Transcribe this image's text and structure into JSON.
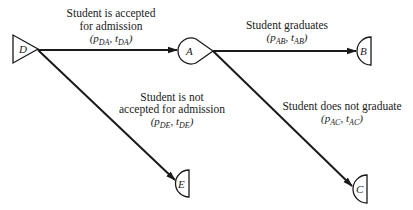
{
  "diagram": {
    "type": "decision-tree",
    "nodes": [
      {
        "id": "D",
        "label": "D",
        "shape": "triangle"
      },
      {
        "id": "A",
        "label": "A",
        "shape": "teardrop"
      },
      {
        "id": "B",
        "label": "B",
        "shape": "half-circle"
      },
      {
        "id": "E",
        "label": "E",
        "shape": "half-circle"
      },
      {
        "id": "C",
        "label": "C",
        "shape": "half-circle"
      }
    ],
    "edges": [
      {
        "from": "D",
        "to": "A",
        "label_lines": [
          "Student is accepted",
          "for admission"
        ],
        "param": {
          "open": "(",
          "p": "p",
          "p_sub": "DA",
          "sep": ", ",
          "t": "t",
          "t_sub": "DA",
          "close": ")"
        }
      },
      {
        "from": "A",
        "to": "B",
        "label_lines": [
          "Student graduates"
        ],
        "param": {
          "open": "(",
          "p": "p",
          "p_sub": "AB",
          "sep": ", ",
          "t": "t",
          "t_sub": "AB",
          "close": ")"
        }
      },
      {
        "from": "D",
        "to": "E",
        "label_lines": [
          "Student is not",
          "accepted for admission"
        ],
        "param": {
          "open": "(",
          "p": "p",
          "p_sub": "DE",
          "sep": ", ",
          "t": "t",
          "t_sub": "DE",
          "close": ")"
        }
      },
      {
        "from": "A",
        "to": "C",
        "label_lines": [
          "Student does not graduate"
        ],
        "param": {
          "open": "(",
          "p": "p",
          "p_sub": "AC",
          "sep": ", ",
          "t": "t",
          "t_sub": "AC",
          "close": ")"
        }
      }
    ]
  }
}
